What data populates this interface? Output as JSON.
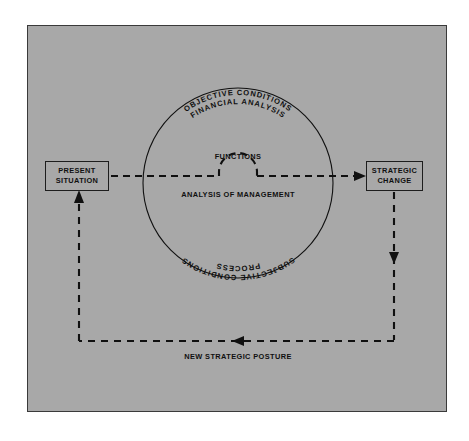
{
  "diagram": {
    "background_color": "#a8a8a8",
    "page_color": "#ffffff",
    "line_color": "#101010",
    "nodes": [
      {
        "id": "present-situation",
        "label_line1": "PRESENT",
        "label_line2": "SITUATION"
      },
      {
        "id": "strategic-change",
        "label_line1": "STRATEGIC",
        "label_line2": "CHANGE"
      }
    ],
    "circle": {
      "center_x": 238,
      "center_y": 183,
      "radius": 95,
      "arc_labels_top": [
        "OBJECTIVE CONDITIONS",
        "FINANCIAL ANALYSIS"
      ],
      "arc_labels_bottom": [
        "PROCESS",
        "SUBJECTIVE CONDITIONS"
      ]
    },
    "center_labels": {
      "above_line": "FUNCTIONS",
      "below_line": "ANALYSIS OF MANAGEMENT"
    },
    "feedback_label": "NEW STRATEGIC POSTURE",
    "connectors": [
      {
        "id": "present-to-strategic",
        "style": "dashed",
        "direction": "right",
        "arrowhead": true
      },
      {
        "id": "strategic-down",
        "style": "dashed",
        "direction": "down",
        "arrowhead": true
      },
      {
        "id": "bottom-return",
        "style": "dashed",
        "direction": "left",
        "arrowhead": true
      },
      {
        "id": "up-to-present",
        "style": "dashed",
        "direction": "up",
        "arrowhead": true
      }
    ]
  }
}
